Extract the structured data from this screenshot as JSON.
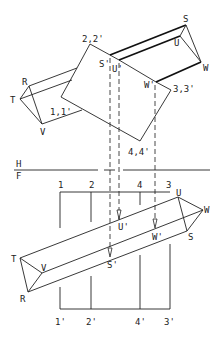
{
  "figure": {
    "type": "descriptive-geometry-drawing",
    "fold_line": {
      "upper": "H",
      "lower": "F"
    },
    "top_view": {
      "plane_labels": [
        "2,2'",
        "3,3'",
        "4,4'",
        "1,1'"
      ],
      "prism_left_labels": [
        "R",
        "T",
        "V"
      ],
      "prism_right_labels": [
        "S",
        "U",
        "W"
      ],
      "piercing_labels": [
        "S'",
        "U'",
        "W'"
      ]
    },
    "front_view": {
      "top_labels": [
        "1",
        "2",
        "4",
        "3"
      ],
      "bottom_labels": [
        "1'",
        "2'",
        "4'",
        "3'"
      ],
      "prism_left_labels": [
        "T",
        "V",
        "R"
      ],
      "prism_right_labels": [
        "U",
        "W",
        "S"
      ],
      "piercing_labels": [
        "U'",
        "W'",
        "S'"
      ]
    }
  }
}
